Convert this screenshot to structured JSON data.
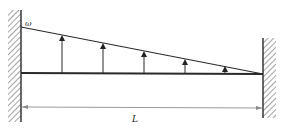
{
  "diagram": {
    "type": "fixed-fixed beam with linearly varying distributed load",
    "load_label": "ω",
    "length_label": "L",
    "colors": {
      "line": "#2a2a2a",
      "dimension_line": "#9a9a9a",
      "background": "#ffffff"
    },
    "supports": [
      {
        "name": "left-fixed-support",
        "side": "left"
      },
      {
        "name": "right-fixed-support",
        "side": "right"
      }
    ],
    "load_arrows_count": 5,
    "load_distribution": "triangular, maximum ω at left end decreasing to zero at right end"
  }
}
